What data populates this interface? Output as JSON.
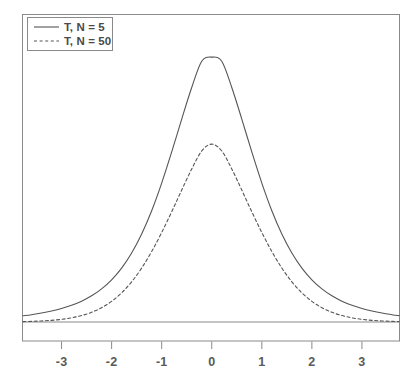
{
  "chart_data": {
    "type": "line",
    "title": "",
    "subtitle": "",
    "xlabel": "",
    "ylabel": "",
    "xlim": [
      -3.77,
      3.74
    ],
    "ylim": [
      0,
      0.44
    ],
    "grid": false,
    "legend_position": "top-left",
    "xticks": [
      -3,
      -2,
      -1,
      0,
      1,
      2,
      3
    ],
    "xtick_labels": [
      "-3",
      "-2",
      "-1",
      "0",
      "1",
      "2",
      "3"
    ],
    "yticks": [],
    "ytick_labels": [],
    "baseline_y": 0,
    "annotations": [],
    "series": [
      {
        "name": "T, N = 5",
        "style": "solid",
        "color": "#555555",
        "x": [
          -3.77,
          -3.6,
          -3.4,
          -3.2,
          -3.0,
          -2.8,
          -2.6,
          -2.4,
          -2.2,
          -2.0,
          -1.8,
          -1.6,
          -1.4,
          -1.2,
          -1.0,
          -0.8,
          -0.6,
          -0.4,
          -0.2,
          0.0,
          0.2,
          0.4,
          0.6,
          0.8,
          1.0,
          1.2,
          1.4,
          1.6,
          1.8,
          2.0,
          2.2,
          2.4,
          2.6,
          2.8,
          3.0,
          3.2,
          3.4,
          3.6,
          3.74
        ],
        "values": [
          0.0089,
          0.0105,
          0.0128,
          0.0157,
          0.0193,
          0.0239,
          0.0298,
          0.0375,
          0.0475,
          0.0605,
          0.0773,
          0.0989,
          0.1261,
          0.1595,
          0.1991,
          0.2437,
          0.2908,
          0.3361,
          0.3738,
          0.3796,
          0.3738,
          0.3361,
          0.2908,
          0.2437,
          0.1991,
          0.1595,
          0.1261,
          0.0989,
          0.0773,
          0.0605,
          0.0475,
          0.0375,
          0.0298,
          0.0239,
          0.0193,
          0.0157,
          0.0128,
          0.0105,
          0.0091
        ]
      },
      {
        "name": "T, N = 50",
        "style": "dashed",
        "color": "#555555",
        "x": [
          -3.77,
          -3.6,
          -3.4,
          -3.2,
          -3.0,
          -2.8,
          -2.6,
          -2.4,
          -2.2,
          -2.0,
          -1.8,
          -1.6,
          -1.4,
          -1.2,
          -1.0,
          -0.8,
          -0.6,
          -0.4,
          -0.2,
          0.0,
          0.2,
          0.4,
          0.6,
          0.8,
          1.0,
          1.2,
          1.4,
          1.6,
          1.8,
          2.0,
          2.2,
          2.4,
          2.6,
          2.8,
          3.0,
          3.2,
          3.4,
          3.6,
          3.74
        ],
        "values": [
          0.0006,
          0.0009,
          0.0015,
          0.0024,
          0.0038,
          0.006,
          0.0092,
          0.0139,
          0.0205,
          0.0296,
          0.0418,
          0.0576,
          0.0773,
          0.101,
          0.1282,
          0.158,
          0.1891,
          0.2193,
          0.2452,
          0.2549,
          0.2452,
          0.2193,
          0.1891,
          0.158,
          0.1282,
          0.101,
          0.0773,
          0.0576,
          0.0418,
          0.0296,
          0.0205,
          0.0139,
          0.0092,
          0.006,
          0.0038,
          0.0024,
          0.0015,
          0.0009,
          0.0006
        ]
      }
    ],
    "legend": [
      {
        "label": "T, N = 5",
        "style": "solid"
      },
      {
        "label": "T, N = 50",
        "style": "dashed"
      }
    ]
  },
  "colors": {
    "background": "#ffffff",
    "axis": "#8a8a8a",
    "curve": "#555555",
    "legend_border": "#8a8a8a",
    "tick_text": "#5a5a5a"
  }
}
